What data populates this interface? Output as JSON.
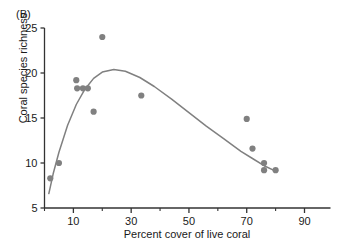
{
  "panel": {
    "label": "(B)"
  },
  "chart_data": {
    "type": "scatter",
    "title": "",
    "xlabel": "Percent cover of live coral",
    "ylabel": "Coral species richness",
    "xlim": [
      0,
      99
    ],
    "ylim": [
      5,
      25
    ],
    "xticks": [
      10,
      30,
      50,
      70,
      90
    ],
    "xtick_labels": [
      "10",
      "30",
      "50",
      "70",
      "90"
    ],
    "xminor_ticks": [
      0,
      20,
      40,
      60,
      80
    ],
    "yticks": [
      5,
      10,
      15,
      20,
      25
    ],
    "ytick_labels": [
      "5",
      "10",
      "15",
      "20",
      "25"
    ],
    "grid": false,
    "legend": null,
    "marker_color": "#808080",
    "line_color": "#808080",
    "axis_color": "#333333",
    "points": [
      {
        "x": 2.0,
        "y": 8.3
      },
      {
        "x": 5.0,
        "y": 10.0
      },
      {
        "x": 11.0,
        "y": 19.2
      },
      {
        "x": 11.3,
        "y": 18.3
      },
      {
        "x": 13.3,
        "y": 18.3
      },
      {
        "x": 15.0,
        "y": 18.3
      },
      {
        "x": 17.0,
        "y": 15.7
      },
      {
        "x": 20.0,
        "y": 24.0
      },
      {
        "x": 33.5,
        "y": 17.5
      },
      {
        "x": 70.0,
        "y": 14.9
      },
      {
        "x": 72.0,
        "y": 11.6
      },
      {
        "x": 76.0,
        "y": 10.0
      },
      {
        "x": 76.0,
        "y": 9.2
      },
      {
        "x": 80.0,
        "y": 9.2
      }
    ],
    "fitted_curve": {
      "description": "unimodal fitted trend line",
      "x": [
        1.5,
        3,
        5,
        8,
        11,
        14,
        17,
        20,
        24,
        28,
        33,
        38,
        44,
        50,
        56,
        62,
        68,
        72,
        76,
        80
      ],
      "y": [
        6.6,
        8.8,
        11.2,
        14.2,
        16.5,
        18.2,
        19.4,
        20.1,
        20.4,
        20.2,
        19.5,
        18.5,
        17.1,
        15.6,
        14.1,
        12.7,
        11.3,
        10.5,
        9.7,
        9.1
      ]
    }
  }
}
